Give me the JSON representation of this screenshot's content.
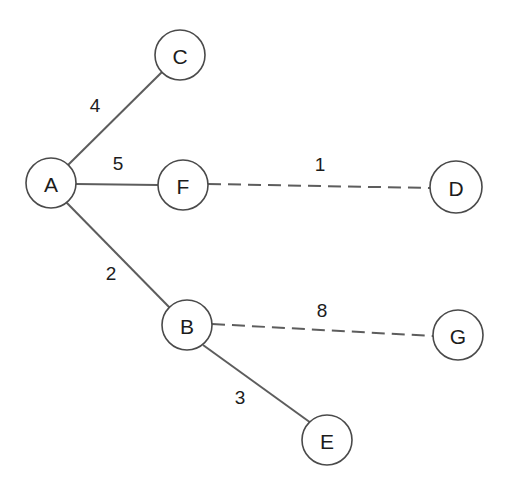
{
  "diagram": {
    "background_color": "#ffffff",
    "node_fill": "#ffffff",
    "node_stroke": "#4a4a4a",
    "edge_color": "#5d5d5d",
    "text_color": "#1c1c1c"
  },
  "nodes": [
    {
      "id": "A",
      "label": "A",
      "cx": 51,
      "cy": 183,
      "r": 25
    },
    {
      "id": "C",
      "label": "C",
      "cx": 180,
      "cy": 55,
      "r": 25
    },
    {
      "id": "F",
      "label": "F",
      "cx": 183,
      "cy": 185,
      "r": 25
    },
    {
      "id": "D",
      "label": "D",
      "cx": 456,
      "cy": 187,
      "r": 26
    },
    {
      "id": "B",
      "label": "B",
      "cx": 187,
      "cy": 325,
      "r": 25
    },
    {
      "id": "G",
      "label": "G",
      "cx": 458,
      "cy": 335,
      "r": 25
    },
    {
      "id": "E",
      "label": "E",
      "cx": 327,
      "cy": 440,
      "r": 25
    }
  ],
  "edges": [
    {
      "id": "A-C",
      "source": "A",
      "target": "C",
      "weight": "4",
      "style": "solid",
      "x1": 68,
      "y1": 165,
      "x2": 162,
      "y2": 72,
      "label_x": 95,
      "label_y": 105
    },
    {
      "id": "A-F",
      "source": "A",
      "target": "F",
      "weight": "5",
      "style": "solid",
      "x1": 76,
      "y1": 184,
      "x2": 158,
      "y2": 185,
      "label_x": 118,
      "label_y": 163
    },
    {
      "id": "F-D",
      "source": "F",
      "target": "D",
      "weight": "1",
      "style": "dashed",
      "x1": 208,
      "y1": 184,
      "x2": 430,
      "y2": 188,
      "label_x": 320,
      "label_y": 164
    },
    {
      "id": "A-B",
      "source": "A",
      "target": "B",
      "weight": "2",
      "style": "solid",
      "x1": 66,
      "y1": 202,
      "x2": 170,
      "y2": 308,
      "label_x": 111,
      "label_y": 273
    },
    {
      "id": "B-G",
      "source": "B",
      "target": "G",
      "weight": "8",
      "style": "dashed",
      "x1": 212,
      "y1": 324,
      "x2": 433,
      "y2": 336,
      "label_x": 322,
      "label_y": 310
    },
    {
      "id": "B-E",
      "source": "B",
      "target": "E",
      "weight": "3",
      "style": "solid",
      "x1": 203,
      "y1": 345,
      "x2": 311,
      "y2": 423,
      "label_x": 240,
      "label_y": 397
    }
  ],
  "chart_data": {
    "type": "diagram",
    "graph_type": "weighted-undirected-graph",
    "node_ids": [
      "A",
      "B",
      "C",
      "D",
      "E",
      "F",
      "G"
    ],
    "edge_list": [
      {
        "from": "A",
        "to": "C",
        "weight": 4,
        "line": "solid"
      },
      {
        "from": "A",
        "to": "F",
        "weight": 5,
        "line": "solid"
      },
      {
        "from": "F",
        "to": "D",
        "weight": 1,
        "line": "dashed"
      },
      {
        "from": "A",
        "to": "B",
        "weight": 2,
        "line": "solid"
      },
      {
        "from": "B",
        "to": "G",
        "weight": 8,
        "line": "dashed"
      },
      {
        "from": "B",
        "to": "E",
        "weight": 3,
        "line": "solid"
      }
    ],
    "title": "",
    "legend": []
  }
}
